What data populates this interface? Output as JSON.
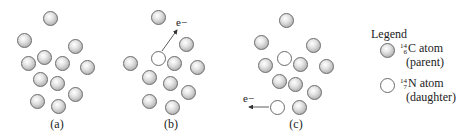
{
  "figure": {
    "panels": [
      {
        "label": "(a)",
        "label_pos": [
          57,
          117
        ],
        "atoms": [
          {
            "type": "parent",
            "x": 50,
            "y": 18
          },
          {
            "type": "parent",
            "x": 24,
            "y": 40
          },
          {
            "type": "parent",
            "x": 75,
            "y": 46
          },
          {
            "type": "parent",
            "x": 44,
            "y": 57
          },
          {
            "type": "parent",
            "x": 28,
            "y": 63
          },
          {
            "type": "parent",
            "x": 62,
            "y": 63
          },
          {
            "type": "parent",
            "x": 87,
            "y": 67
          },
          {
            "type": "parent",
            "x": 40,
            "y": 79
          },
          {
            "type": "parent",
            "x": 57,
            "y": 83
          },
          {
            "type": "parent",
            "x": 75,
            "y": 94
          },
          {
            "type": "parent",
            "x": 37,
            "y": 101
          },
          {
            "type": "parent",
            "x": 58,
            "y": 106
          }
        ]
      },
      {
        "label": "(b)",
        "label_pos": [
          171,
          117
        ],
        "electron": {
          "label": "e−",
          "x": 176,
          "y": 16,
          "arrow": [
            162,
            51,
            177,
            30
          ]
        },
        "atoms": [
          {
            "type": "parent",
            "x": 158,
            "y": 17
          },
          {
            "type": "parent",
            "x": 186,
            "y": 44
          },
          {
            "type": "daughter",
            "x": 158,
            "y": 58
          },
          {
            "type": "parent",
            "x": 130,
            "y": 63
          },
          {
            "type": "parent",
            "x": 174,
            "y": 63
          },
          {
            "type": "parent",
            "x": 197,
            "y": 67
          },
          {
            "type": "parent",
            "x": 149,
            "y": 77
          },
          {
            "type": "parent",
            "x": 170,
            "y": 83
          },
          {
            "type": "parent",
            "x": 188,
            "y": 92
          },
          {
            "type": "parent",
            "x": 149,
            "y": 101
          },
          {
            "type": "parent",
            "x": 172,
            "y": 107
          }
        ]
      },
      {
        "label": "(c)",
        "label_pos": [
          296,
          117
        ],
        "electron": {
          "label": "e−",
          "x": 243,
          "y": 92,
          "arrow": [
            269,
            107,
            249,
            107
          ]
        },
        "atoms": [
          {
            "type": "parent",
            "x": 286,
            "y": 20
          },
          {
            "type": "parent",
            "x": 261,
            "y": 42
          },
          {
            "type": "parent",
            "x": 313,
            "y": 45
          },
          {
            "type": "daughter",
            "x": 284,
            "y": 58
          },
          {
            "type": "parent",
            "x": 265,
            "y": 65
          },
          {
            "type": "parent",
            "x": 300,
            "y": 64
          },
          {
            "type": "parent",
            "x": 326,
            "y": 66
          },
          {
            "type": "parent",
            "x": 279,
            "y": 81
          },
          {
            "type": "parent",
            "x": 295,
            "y": 84
          },
          {
            "type": "parent",
            "x": 314,
            "y": 92
          },
          {
            "type": "daughter",
            "x": 277,
            "y": 107
          },
          {
            "type": "parent",
            "x": 299,
            "y": 107
          }
        ]
      }
    ]
  },
  "legend": {
    "title": "Legend",
    "items": [
      {
        "type": "parent",
        "mass": "14",
        "atomic": "6",
        "symbol": "C",
        "text": "C atom",
        "sub": "(parent)"
      },
      {
        "type": "daughter",
        "mass": "14",
        "atomic": "7",
        "symbol": "N",
        "text": "N atom",
        "sub": "(daughter)"
      }
    ]
  },
  "colors": {
    "parent_fill": "#c8c8c8",
    "daughter_fill": "#ffffff",
    "outline": "#6a6a6a",
    "arrow": "#333333"
  }
}
